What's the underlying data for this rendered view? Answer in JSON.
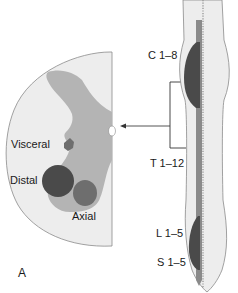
{
  "figure": {
    "panel_label": "A",
    "cross_section": {
      "labels": {
        "visceral": "Visceral",
        "distal": "Distal",
        "axial": "Axial"
      }
    },
    "spinal_cord": {
      "segments": [
        {
          "id": "cervical",
          "label": "C 1–8"
        },
        {
          "id": "thoracic",
          "label": "T 1–12"
        },
        {
          "id": "lumbar",
          "label": "L 1–5"
        },
        {
          "id": "sacral",
          "label": "S 1–5"
        }
      ]
    },
    "colors": {
      "white_matter": "#ededed",
      "gray_matter": "#b4b4b4",
      "motor_nuclei_dark": "#4a4a4a",
      "motor_nuclei_mid": "#6e6e6e",
      "outline": "#8a8a8a",
      "arrow": "#555555"
    }
  }
}
